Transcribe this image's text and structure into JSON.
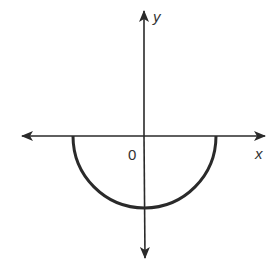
{
  "diagram": {
    "type": "coordinate-plane-graph",
    "axes": {
      "x_label": "x",
      "y_label": "y",
      "origin_label": "0"
    },
    "curve": {
      "shape": "lower-semicircle",
      "center": [
        0,
        0
      ],
      "endpoints": [
        "left x-intercept",
        "right x-intercept"
      ],
      "lowest_point": "negative y-intercept"
    },
    "colors": {
      "background": "#ffffff",
      "stroke": "#2a2a2a",
      "label": "#333333"
    }
  }
}
